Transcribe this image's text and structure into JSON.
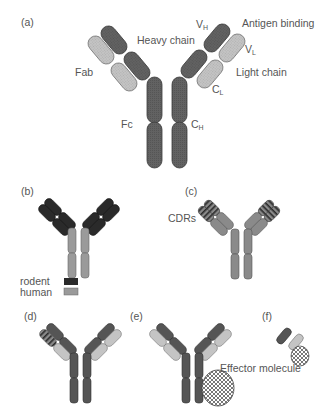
{
  "colors": {
    "heavy": "#5f5f5f",
    "heavy_stroke": "#3a3a3a",
    "light": "#bdbdbd",
    "light_stroke": "#777777",
    "rodent": "#2a2a2a",
    "human": "#9a9a9a",
    "text": "#555555"
  },
  "panels": {
    "a": {
      "label": "(a)",
      "vh": "V",
      "vh_sub": "H",
      "antigen_binding": "Antigen binding",
      "heavy_chain": "Heavy chain",
      "vl": "V",
      "vl_sub": "L",
      "fab": "Fab",
      "light_chain": "Light chain",
      "cl": "C",
      "cl_sub": "L",
      "fc": "Fc",
      "ch": "C",
      "ch_sub": "H"
    },
    "b": {
      "label": "(b)",
      "legend": [
        {
          "label": "rodent",
          "color": "#2a2a2a"
        },
        {
          "label": "human",
          "color": "#9a9a9a"
        }
      ]
    },
    "c": {
      "label": "(c)",
      "cdrs": "CDRs"
    },
    "d": {
      "label": "(d)"
    },
    "e": {
      "label": "(e)"
    },
    "f": {
      "label": "(f)",
      "effector": "Effector molecule"
    }
  }
}
